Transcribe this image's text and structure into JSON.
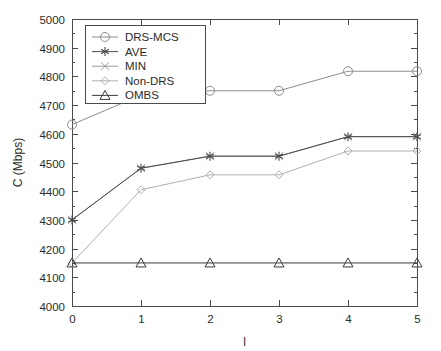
{
  "chart_data": {
    "type": "line",
    "title": "",
    "xlabel": "l",
    "ylabel": "C (Mbps)",
    "x": [
      0,
      1,
      2,
      3,
      4,
      5
    ],
    "xlim": [
      0,
      5
    ],
    "ylim": [
      4000,
      5000
    ],
    "xticks": [
      "0",
      "1",
      "2",
      "3",
      "4",
      "5"
    ],
    "yticks": [
      "4000",
      "4100",
      "4200",
      "4300",
      "4400",
      "4500",
      "4600",
      "4700",
      "4800",
      "4900",
      "5000"
    ],
    "grid": false,
    "legend_position": "upper-left",
    "series": [
      {
        "name": "DRS-MCS",
        "marker": "circle",
        "color": "#8c8c8c",
        "values": [
          4632,
          4735,
          4750,
          4750,
          4818,
          4818
        ]
      },
      {
        "name": "AVE",
        "marker": "asterisk",
        "color": "#4a4a4a",
        "values": [
          4300,
          4480,
          4522,
          4522,
          4590,
          4590
        ]
      },
      {
        "name": "MIN",
        "marker": "x",
        "color": "#9a9a9a",
        "values": [
          4300,
          4480,
          4522,
          4522,
          4590,
          4590
        ]
      },
      {
        "name": "Non-DRS",
        "marker": "diamond",
        "color": "#b0b0b0",
        "values": [
          4150,
          4405,
          4457,
          4457,
          4540,
          4540
        ]
      },
      {
        "name": "OMBS",
        "marker": "triangle",
        "color": "#3c3c3c",
        "values": [
          4150,
          4150,
          4150,
          4150,
          4150,
          4150
        ]
      }
    ]
  },
  "legend": {
    "items": [
      {
        "label": "DRS-MCS"
      },
      {
        "label": "AVE"
      },
      {
        "label": "MIN"
      },
      {
        "label": "Non-DRS"
      },
      {
        "label": "OMBS"
      }
    ]
  }
}
